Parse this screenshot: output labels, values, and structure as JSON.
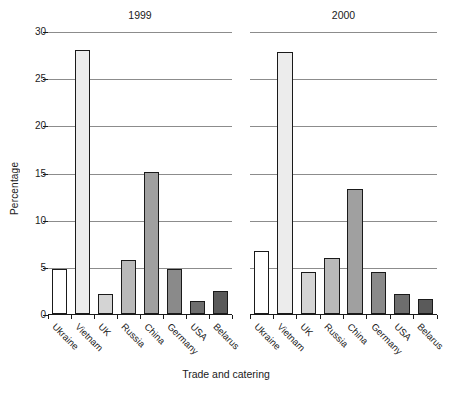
{
  "chart_data": {
    "type": "bar",
    "title": "",
    "xlabel": "Trade and catering",
    "ylabel": "Percentage",
    "ylim": [
      0,
      30
    ],
    "yticks": [
      0,
      5,
      10,
      15,
      20,
      25,
      30
    ],
    "grid": true,
    "legend": "none",
    "categories": [
      "Ukraine",
      "Vietnam",
      "UK",
      "Russia",
      "China",
      "Germany",
      "USA",
      "Belarus"
    ],
    "panels": [
      {
        "title": "1999",
        "values": [
          4.8,
          28.0,
          2.1,
          5.7,
          15.1,
          4.8,
          1.4,
          2.4
        ]
      },
      {
        "title": "2000",
        "values": [
          6.7,
          27.8,
          4.5,
          5.9,
          13.2,
          4.5,
          2.1,
          1.6
        ]
      }
    ],
    "bar_colors": [
      "#ffffff",
      "#ececec",
      "#d4d4d4",
      "#b9b9b9",
      "#a0a0a0",
      "#8a8a8a",
      "#6e6e6e",
      "#5a5a5a"
    ],
    "bar_outline": "#1a1a1a",
    "gridline_color": "#8c8c8c"
  }
}
